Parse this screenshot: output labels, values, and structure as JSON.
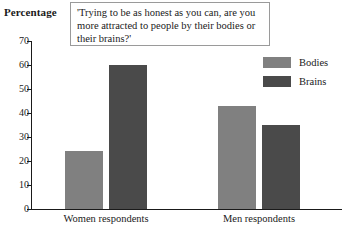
{
  "chart_data": {
    "type": "bar",
    "title": "",
    "xlabel": "",
    "ylabel": "Percentage",
    "ylim": [
      0,
      70
    ],
    "ytick_labels": [
      "70",
      "60",
      "50",
      "40",
      "30",
      "20",
      "10",
      "0"
    ],
    "ytick_values": [
      70,
      60,
      50,
      40,
      30,
      20,
      10,
      0
    ],
    "grid": false,
    "legend_position": "right",
    "categories": [
      "Women respondents",
      "Men respondents"
    ],
    "series": [
      {
        "name": "Bodies",
        "color": "#808080",
        "values": [
          24,
          43
        ]
      },
      {
        "name": "Brains",
        "color": "#4a4a4a",
        "values": [
          60,
          35
        ]
      }
    ],
    "annotation": "'Trying to be as honest as you can, are you more attracted to people by their bodies or their brains?'"
  },
  "axis": {
    "y_title": "Percentage"
  },
  "quote": {
    "text": "'Trying to be as honest as you can, are you more attracted to people by their bodies or their brains?'"
  },
  "legend": {
    "items": [
      {
        "label": "Bodies"
      },
      {
        "label": "Brains"
      }
    ]
  },
  "groups": [
    {
      "label": "Women respondents"
    },
    {
      "label": "Men respondents"
    }
  ]
}
